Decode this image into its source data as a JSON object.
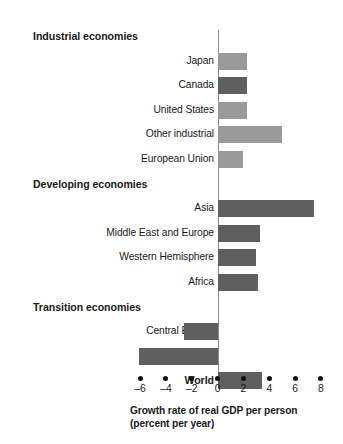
{
  "chart_data": {
    "type": "bar",
    "orientation": "horizontal",
    "title": "",
    "xlabel": "Growth rate of real GDP per person (percent per year)",
    "ylabel": "",
    "xlim": [
      -7,
      8.6
    ],
    "xticks": [
      -6,
      -4,
      -2,
      0,
      2,
      4,
      6,
      8
    ],
    "xtick_labels": [
      "–6",
      "–4",
      "–2",
      "0",
      "2",
      "4",
      "6",
      "8"
    ],
    "grid": false,
    "legend": null,
    "zero_line": 0,
    "colors": {
      "light_bar": "#9a9a9a",
      "dark_bar": "#5f5f5f",
      "axis": "#8d8d8d",
      "text": "#1a1a1a",
      "background": "#ffffff"
    },
    "rows": [
      {
        "kind": "group",
        "label": "Industrial economies",
        "value": null,
        "shade": null
      },
      {
        "kind": "bar",
        "label": "Japan",
        "value": 2.25,
        "shade": "light"
      },
      {
        "kind": "bar",
        "label": "Canada",
        "value": 2.25,
        "shade": "dark"
      },
      {
        "kind": "bar",
        "label": "United States",
        "value": 2.25,
        "shade": "light"
      },
      {
        "kind": "bar",
        "label": "Other industrial",
        "value": 5.0,
        "shade": "light"
      },
      {
        "kind": "bar",
        "label": "European Union",
        "value": 2.0,
        "shade": "light"
      },
      {
        "kind": "group",
        "label": "Developing economies",
        "value": null,
        "shade": null
      },
      {
        "kind": "bar",
        "label": "Asia",
        "value": 7.5,
        "shade": "dark"
      },
      {
        "kind": "bar",
        "label": "Middle East and Europe",
        "value": 3.25,
        "shade": "dark"
      },
      {
        "kind": "bar",
        "label": "Western Hemisphere",
        "value": 3.0,
        "shade": "dark"
      },
      {
        "kind": "bar",
        "label": "Africa",
        "value": 3.1,
        "shade": "dark"
      },
      {
        "kind": "group",
        "label": "Transition economies",
        "value": null,
        "shade": null
      },
      {
        "kind": "bar",
        "label": "Central Europe",
        "value": -2.6,
        "shade": "dark"
      },
      {
        "kind": "bar",
        "label": "Russia",
        "value": -6.1,
        "shade": "dark"
      },
      {
        "kind": "group-bar",
        "label": "World",
        "value": 3.4,
        "shade": "dark"
      }
    ]
  },
  "axis": {
    "title_line1": "Growth rate of real GDP per person",
    "title_line2": "(percent per year)"
  }
}
